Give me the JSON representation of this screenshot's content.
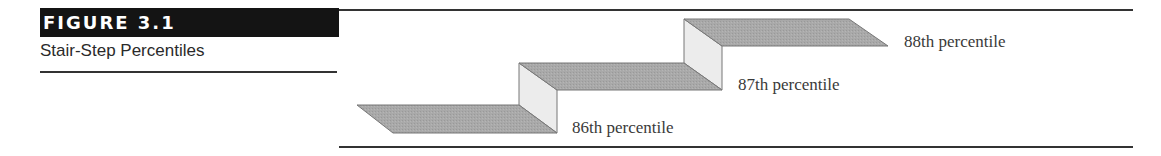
{
  "figure": {
    "label": "FIGURE 3.1",
    "title": "Stair-Step Percentiles"
  },
  "diagram": {
    "type": "stair-step",
    "colors": {
      "tread": "#a8a8a8",
      "riser": "#ececec",
      "outline": "#7a7a7a"
    },
    "steps": [
      {
        "label": "86th percentile"
      },
      {
        "label": "87th percentile"
      },
      {
        "label": "88th percentile"
      }
    ]
  }
}
